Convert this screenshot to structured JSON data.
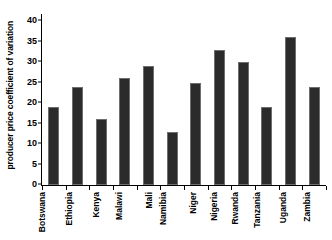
{
  "chart_data": {
    "type": "bar",
    "title": "",
    "xlabel": "",
    "ylabel": "producer price coefficient of variation",
    "ylim": [
      0,
      40
    ],
    "yticks": [
      0,
      5,
      10,
      15,
      20,
      25,
      30,
      35,
      40
    ],
    "grid": false,
    "legend": "none",
    "bar_color": "#2b2b2b",
    "categories": [
      "Botswana",
      "Ethiopia",
      "Kenya",
      "Malawi",
      "Mali",
      "Namibia",
      "Niger",
      "Nigeria",
      "Rwanda",
      "Tanzania",
      "Uganda",
      "Zambia"
    ],
    "values": [
      19,
      24,
      16,
      26,
      29,
      13,
      25,
      33,
      30,
      19,
      36,
      24
    ]
  }
}
